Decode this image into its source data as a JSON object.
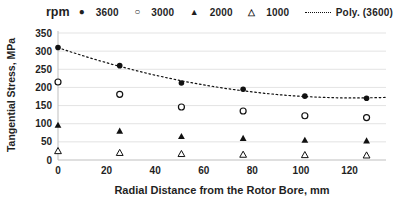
{
  "chart_data": {
    "type": "scatter",
    "title": "",
    "legend_title": "rpm",
    "legend_position": "top",
    "xlabel": "Radial Distance from the Rotor Bore, mm",
    "ylabel": "Tangential Stress, MPa",
    "xlim": [
      0,
      135
    ],
    "ylim": [
      0,
      350
    ],
    "x_ticks": [
      0,
      20,
      40,
      60,
      80,
      100,
      120
    ],
    "y_ticks": [
      0,
      50,
      100,
      150,
      200,
      250,
      300,
      350
    ],
    "grid": "horizontal",
    "x": [
      0,
      25.4,
      50.8,
      76.2,
      101.6,
      127
    ],
    "series": [
      {
        "name": "3600",
        "marker": "filled-circle",
        "glyph": "●",
        "values": [
          310,
          260,
          212,
          195,
          176,
          170
        ]
      },
      {
        "name": "3000",
        "marker": "open-circle",
        "glyph": "○",
        "values": [
          215,
          181,
          146,
          135,
          122,
          117
        ]
      },
      {
        "name": "2000",
        "marker": "filled-triangle",
        "glyph": "▲",
        "values": [
          96,
          80,
          65,
          60,
          55,
          53
        ]
      },
      {
        "name": "1000",
        "marker": "open-triangle",
        "glyph": "△",
        "values": [
          25,
          20,
          17,
          15,
          14,
          13
        ]
      }
    ],
    "trendline": {
      "label": "Poly. (3600)",
      "series": "3600",
      "order": 2,
      "style": "dotted"
    }
  },
  "colors": {
    "marker": "#111111",
    "text": "#1f1f1f",
    "axis": "#bfbfbf",
    "grid": "#dcdcdc",
    "background": "#ffffff"
  }
}
